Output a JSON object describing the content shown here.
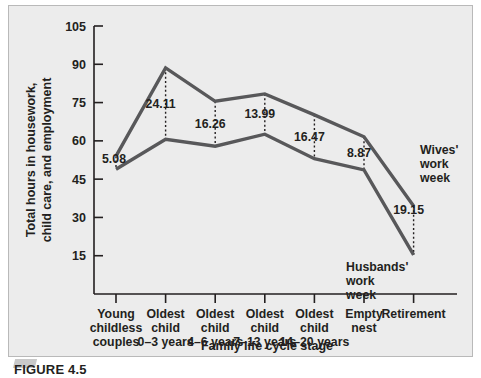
{
  "figure": {
    "caption": "FIGURE 4.5",
    "background_color": "#ececec",
    "line_color": "#58585a",
    "axis_color": "#231f20"
  },
  "chart_data": {
    "type": "line",
    "title": "",
    "xlabel": "Family life cycle stage",
    "ylabel": "Total hours in housework, child care, and employment",
    "ylim": [
      0,
      105
    ],
    "yticks": [
      15,
      30,
      45,
      60,
      75,
      90,
      105
    ],
    "grid": false,
    "legend_position": "inline-right",
    "categories": [
      "Young childless couples",
      "Oldest child 0–3 years",
      "Oldest child 4–6 years",
      "Oldest child 7–13 years",
      "Oldest child 14–20 years",
      "Empty nest",
      "Retirement"
    ],
    "category_lines": [
      [
        "Young",
        "childless",
        "couples"
      ],
      [
        "Oldest",
        "child",
        "0–3 years"
      ],
      [
        "Oldest",
        "child",
        "4–6 years"
      ],
      [
        "Oldest",
        "child",
        "7–13 years"
      ],
      [
        "Oldest",
        "child",
        "14–20 years"
      ],
      [
        "Empty",
        "nest"
      ],
      [
        "Retirement"
      ]
    ],
    "series": [
      {
        "name": "Wives' work week",
        "label_lines": [
          "Wives'",
          "work",
          "week"
        ],
        "values": [
          54.0,
          88.6,
          75.5,
          78.4,
          70.2,
          61.6,
          34.5
        ]
      },
      {
        "name": "Husbands' work week",
        "label_lines": [
          "Husbands'",
          "work",
          "week"
        ],
        "values": [
          48.9,
          60.6,
          57.9,
          62.6,
          53.0,
          48.6,
          15.3
        ]
      }
    ],
    "difference_labels": [
      "5.08",
      "24.11",
      "16.26",
      "13.99",
      "16.47",
      "8.87",
      "19.15"
    ],
    "annotations": [
      {
        "text": "5.08",
        "category": "Young childless couples"
      },
      {
        "text": "24.11",
        "category": "Oldest child 0–3 years"
      },
      {
        "text": "16.26",
        "category": "Oldest child 4–6 years"
      },
      {
        "text": "13.99",
        "category": "Oldest child 7–13 years"
      },
      {
        "text": "16.47",
        "category": "Oldest child 14–20 years"
      },
      {
        "text": "8.87",
        "category": "Empty nest"
      },
      {
        "text": "19.15",
        "category": "Retirement"
      }
    ]
  }
}
